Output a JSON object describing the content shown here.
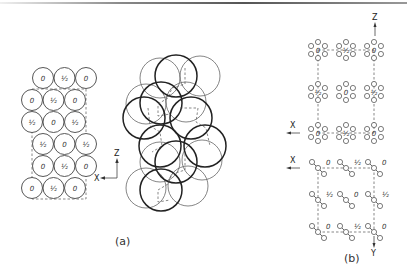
{
  "figure": {
    "panel_a": {
      "caption": "(a)",
      "axes": {
        "z_label": "Z",
        "x_label": "X"
      },
      "grid": [
        {
          "row": 1,
          "offset": true,
          "labels": [
            "0",
            "½",
            "0"
          ]
        },
        {
          "row": 2,
          "offset": false,
          "labels": [
            "0",
            "½",
            "0"
          ]
        },
        {
          "row": 3,
          "offset": false,
          "labels": [
            "½",
            "0",
            "½"
          ]
        },
        {
          "row": 4,
          "offset": true,
          "labels": [
            "½",
            "0",
            "½"
          ]
        },
        {
          "row": 5,
          "offset": true,
          "labels": [
            "0",
            "½",
            "0"
          ]
        },
        {
          "row": 6,
          "offset": false,
          "labels": [
            "0",
            "½",
            "0"
          ]
        }
      ]
    },
    "panel_b": {
      "caption": "(b)",
      "axes_top": {
        "z_label": "Z",
        "x_label": "X"
      },
      "axes_bottom": {
        "x_label": "X",
        "y_label": "Y"
      },
      "top_rows": [
        [
          "0",
          "½",
          "0"
        ],
        [
          "½",
          "0",
          "½"
        ],
        [
          "0",
          "½",
          "0"
        ]
      ],
      "bottom_rows": [
        [
          "0",
          "½",
          "0"
        ],
        [
          "½",
          "0",
          "½"
        ],
        [
          "0",
          "½",
          "0"
        ]
      ]
    }
  }
}
